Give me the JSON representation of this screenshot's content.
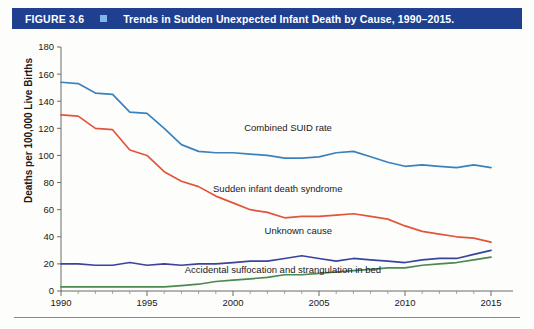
{
  "figure": {
    "number_label": "FIGURE 3.6",
    "bullet_icon": "square-bullet-icon",
    "title": "Trends in Sudden Unexpected Infant Death by Cause, 1990–2015.",
    "header_bg_color": "#1f3f8f",
    "header_bullet_color": "#7fb8e6"
  },
  "chart_data": {
    "type": "line",
    "xlabel": "",
    "ylabel": "Deaths per 100,000 Live Births",
    "xlim": [
      1990,
      2015
    ],
    "ylim": [
      0,
      180
    ],
    "ytick_step": 20,
    "yticks": [
      0,
      20,
      40,
      60,
      80,
      100,
      120,
      140,
      160,
      180
    ],
    "xticks": [
      1990,
      1995,
      2000,
      2005,
      2010,
      2015
    ],
    "x": [
      1990,
      1991,
      1992,
      1993,
      1994,
      1995,
      1996,
      1997,
      1998,
      1999,
      2000,
      2001,
      2002,
      2003,
      2004,
      2005,
      2006,
      2007,
      2008,
      2009,
      2010,
      2011,
      2012,
      2013,
      2014,
      2015
    ],
    "grid": false,
    "legend_position": "inline-annotations",
    "series": [
      {
        "name": "Combined SUID rate",
        "color": "#3b82bd",
        "label_x": 2003.2,
        "label_y": 118,
        "values": [
          154,
          153,
          146,
          145,
          132,
          131,
          120,
          108,
          103,
          102,
          102,
          101,
          100,
          98,
          98,
          99,
          102,
          103,
          99,
          95,
          92,
          93,
          92,
          91,
          93,
          91
        ]
      },
      {
        "name": "Sudden infant death syndrome",
        "color": "#e2553a",
        "label_x": 2002.6,
        "label_y": 73,
        "values": [
          130,
          129,
          120,
          119,
          104,
          100,
          88,
          81,
          77,
          70,
          65,
          60,
          58,
          54,
          55,
          55,
          56,
          57,
          55,
          53,
          48,
          44,
          42,
          40,
          39,
          36
        ]
      },
      {
        "name": "Unknown cause",
        "color": "#39459b",
        "label_x": 2003.8,
        "label_y": 42,
        "values": [
          20,
          20,
          19,
          19,
          21,
          19,
          20,
          19,
          20,
          20,
          21,
          22,
          22,
          24,
          26,
          24,
          22,
          24,
          23,
          22,
          21,
          23,
          24,
          24,
          27,
          30
        ]
      },
      {
        "name": "Accidental suffocation and strangulation in bed",
        "color": "#4a8a4e",
        "label_x": 2002.9,
        "label_y": 13,
        "values": [
          3,
          3,
          3,
          3,
          3,
          3,
          3,
          4,
          5,
          7,
          8,
          9,
          10,
          12,
          12,
          13,
          14,
          15,
          16,
          17,
          17,
          19,
          20,
          21,
          23,
          25
        ]
      }
    ]
  },
  "axes": {
    "y_tick_labels": [
      "180",
      "160",
      "140",
      "120",
      "100",
      "80",
      "60",
      "40",
      "20",
      "0"
    ],
    "x_tick_labels": [
      "1990",
      "1995",
      "2000",
      "2005",
      "2010",
      "2015"
    ]
  }
}
